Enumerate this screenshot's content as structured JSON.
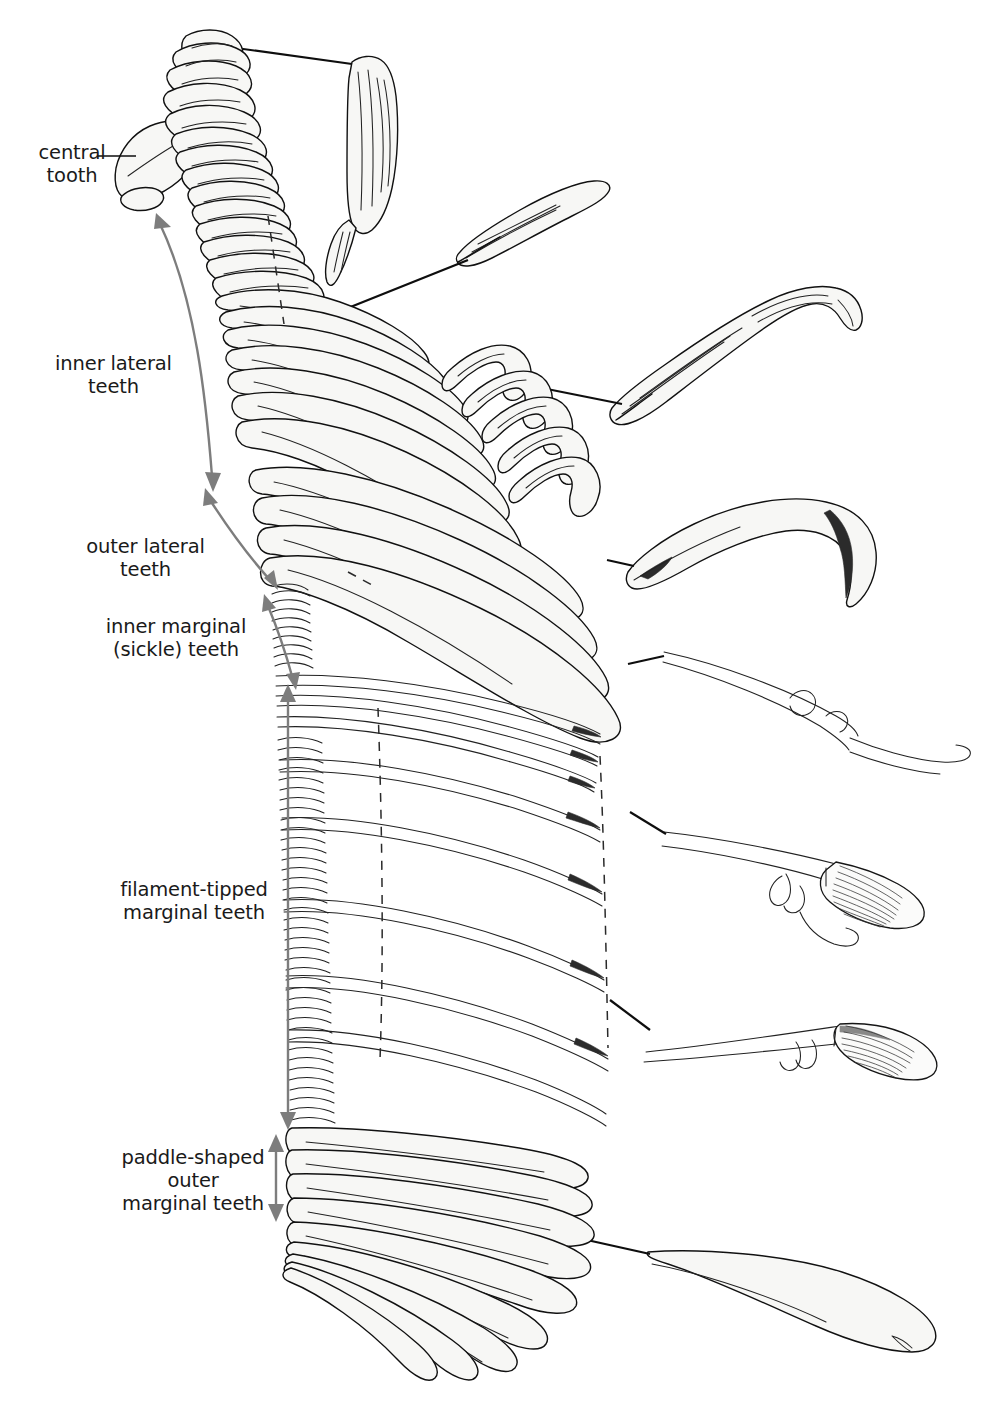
{
  "figure": {
    "title_visible": false,
    "background_color": "#ffffff",
    "ink_color": "#111111",
    "text_color": "#1a1a1a",
    "arrow_color": "#7d7d7d",
    "tooth_fill": "#f7f7f5"
  },
  "labels": [
    {
      "id": "central-tooth",
      "text": "central\ntooth",
      "x": 18,
      "y": 141,
      "width": 108,
      "align": "right",
      "connector": "leader-line"
    },
    {
      "id": "inner-lateral-teeth",
      "text": "inner lateral\nteeth",
      "x": 46,
      "y": 352,
      "width": 135,
      "align": "center",
      "connector": "curved-double-arrow"
    },
    {
      "id": "outer-lateral-teeth",
      "text": "outer lateral\nteeth",
      "x": 78,
      "y": 535,
      "width": 135,
      "align": "center",
      "connector": "double-arrow"
    },
    {
      "id": "inner-marginal-teeth",
      "text": "inner marginal\n(sickle) teeth",
      "x": 96,
      "y": 615,
      "width": 160,
      "align": "center",
      "connector": "double-arrow"
    },
    {
      "id": "filament-tipped-teeth",
      "text": "filament-tipped\nmarginal teeth",
      "x": 110,
      "y": 878,
      "width": 168,
      "align": "center",
      "connector": "double-arrow"
    },
    {
      "id": "paddle-shaped-teeth",
      "text": "paddle-shaped\nouter\nmarginal teeth",
      "x": 104,
      "y": 1146,
      "width": 178,
      "align": "center",
      "connector": "double-arrow"
    }
  ],
  "detail_insets": [
    {
      "id": "central-tooth-detail",
      "description": "elongate blade-like central tooth",
      "leader_from": [
        207,
        42
      ],
      "leader_to": [
        352,
        63
      ]
    },
    {
      "id": "inner-lateral-tooth-detail",
      "description": "lanceolate inner lateral tooth",
      "leader_from": [
        318,
        318
      ],
      "leader_to": [
        470,
        262
      ]
    },
    {
      "id": "outer-lateral-tooth-detail",
      "description": "hooked outer lateral tooth",
      "leader_from": [
        512,
        382
      ],
      "leader_to": [
        620,
        400
      ]
    },
    {
      "id": "sickle-tooth-detail",
      "description": "curved sickle marginal tooth",
      "leader_from": [
        607,
        560
      ],
      "leader_to": [
        650,
        556
      ]
    },
    {
      "id": "denticulate-tooth-detail",
      "description": "slender tooth with two denticles",
      "leader_from": [
        600,
        668
      ],
      "leader_to": [
        665,
        655
      ]
    },
    {
      "id": "filament-tooth-detail-1",
      "description": "filament-tipped tooth with striated brush",
      "leader_from": [
        602,
        806
      ],
      "leader_to": [
        660,
        830
      ]
    },
    {
      "id": "filament-tooth-detail-2",
      "description": "filament-tipped tooth, striated tip",
      "leader_from": [
        607,
        1000
      ],
      "leader_to": [
        648,
        1030
      ]
    },
    {
      "id": "paddle-tooth-detail",
      "description": "broad paddle-shaped outer marginal tooth",
      "leader_from": [
        578,
        1238
      ],
      "leader_to": [
        648,
        1254
      ]
    }
  ],
  "structure": {
    "tooth_row_bands": [
      {
        "name": "central",
        "count": 1
      },
      {
        "name": "inner-lateral",
        "count": 22
      },
      {
        "name": "outer-lateral",
        "count": 10
      },
      {
        "name": "inner-marginal",
        "count": 9
      },
      {
        "name": "filament-tipped",
        "count": 58
      },
      {
        "name": "paddle-shaped",
        "count": 22
      }
    ],
    "dashed_reference_lines": 3
  }
}
